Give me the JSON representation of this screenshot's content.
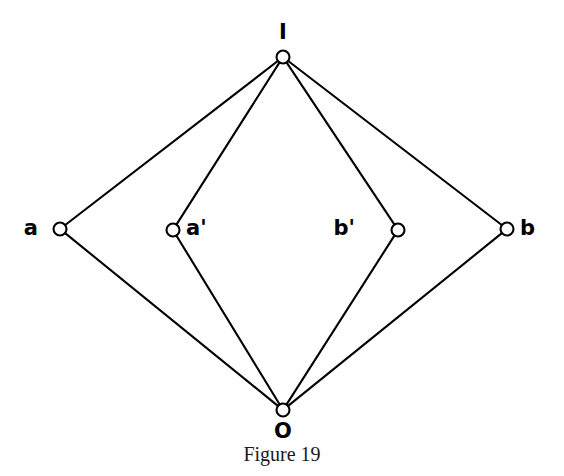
{
  "figure": {
    "caption": "Figure 19",
    "type": "lattice-hasse-diagram",
    "background_color": "#ffffff",
    "stroke_color": "#000000",
    "node_fill_color": "#ffffff",
    "nodes": [
      {
        "id": "I",
        "label": "I",
        "cx": 283,
        "cy": 57,
        "r": 6.5,
        "label_x": 283,
        "label_y": 22,
        "label_anchor": "center",
        "role": "top-unit"
      },
      {
        "id": "a",
        "label": "a",
        "cx": 60,
        "cy": 229,
        "r": 6.5,
        "label_x": 38,
        "label_y": 218,
        "label_anchor": "left",
        "role": "middle-outer-left"
      },
      {
        "id": "ap",
        "label": "a'",
        "cx": 173,
        "cy": 230,
        "r": 6.5,
        "label_x": 186,
        "label_y": 218,
        "label_anchor": "right",
        "role": "middle-inner-left"
      },
      {
        "id": "bp",
        "label": "b'",
        "cx": 398,
        "cy": 230,
        "r": 6.5,
        "label_x": 355,
        "label_y": 218,
        "label_anchor": "left",
        "role": "middle-inner-right"
      },
      {
        "id": "b",
        "label": "b",
        "cx": 507,
        "cy": 229,
        "r": 6.5,
        "label_x": 520,
        "label_y": 218,
        "label_anchor": "right",
        "role": "middle-outer-right"
      },
      {
        "id": "O",
        "label": "O",
        "cx": 283,
        "cy": 410,
        "r": 6.5,
        "label_x": 283,
        "label_y": 421,
        "label_anchor": "center",
        "role": "bottom-zero"
      }
    ],
    "edges": [
      {
        "from": "I",
        "to": "a"
      },
      {
        "from": "I",
        "to": "ap"
      },
      {
        "from": "I",
        "to": "bp"
      },
      {
        "from": "I",
        "to": "b"
      },
      {
        "from": "a",
        "to": "O"
      },
      {
        "from": "ap",
        "to": "O"
      },
      {
        "from": "bp",
        "to": "O"
      },
      {
        "from": "b",
        "to": "O"
      }
    ]
  }
}
